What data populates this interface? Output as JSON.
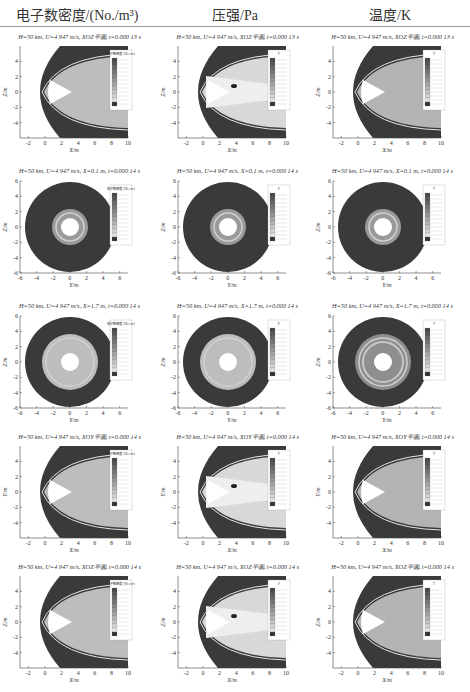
{
  "header": {
    "columns": [
      {
        "label": "电子数密度/(No./m³)",
        "variable": "electron_number_density"
      },
      {
        "label": "压强/Pa",
        "variable": "pressure"
      },
      {
        "label": "温度/K",
        "variable": "temperature"
      }
    ]
  },
  "rows": [
    {
      "caption_0": "H=50 km, U=4 947 m/s, XOZ平面, t=0.000 13 s",
      "caption_1": "H=50 km, U=4 947 m/s, XOZ平面, t=0.000 13 s",
      "caption_2": "H=50 km, U=4 947 m/s, XOZ平面, t=0.000 13 s",
      "kind": "side",
      "xlabel": "X/m",
      "ylabel": "Z/m"
    },
    {
      "caption_0": "H=50 km, U=4 947 m/s, X=0.1 m, t=0.000 14 s",
      "caption_1": "H=50 km, U=4 947 m/s, X=0.1 m, t=0.000 14 s",
      "caption_2": "H=50 km, U=4 947 m/s, X=0.1 m, t=0.000 14 s",
      "kind": "section",
      "xlabel": "Y/m",
      "ylabel": "Z/m"
    },
    {
      "caption_0": "H=50 km, U=4 947 m/s, X=1.7 m, t=0.000 14 s",
      "caption_1": "H=50 km, U=4 947 m/s, X=1.7 m, t=0.000 14 s",
      "caption_2": "H=50 km, U=4 947 m/s, X=1.7 m, t=0.000 14 s",
      "kind": "section",
      "xlabel": "Y/m",
      "ylabel": "Z/m"
    },
    {
      "caption_0": "H=50 km, U=4 947 m/s, XOY平面, t=0.000 14 s",
      "caption_1": "H=50 km, U=4 947 m/s, XOY平面, t=0.000 14 s",
      "caption_2": "H=50 km, U=4 947 m/s, XOY平面, t=0.000 14 s",
      "kind": "side",
      "xlabel": "X/m",
      "ylabel": "Y/m"
    },
    {
      "caption_0": "H=50 km, U=4 947 m/s, XOZ平面, t=0.000 14 s",
      "caption_1": "H=50 km, U=4 947 m/s, XOZ平面, t=0.000 14 s",
      "caption_2": "H=50 km, U=4 947 m/s, XOZ平面, t=0.000 14 s",
      "kind": "side",
      "xlabel": "X/m",
      "ylabel": "Z/m"
    }
  ],
  "legend_titles": {
    "density": "电子数密度 /(No./m³)",
    "pressure": "P",
    "temperature": "T"
  },
  "chart_data": {
    "type": "heatmap",
    "layout": {
      "rows": 5,
      "cols": 3
    },
    "column_titles": [
      "电子数密度/(No./m³)",
      "压强/Pa",
      "温度/K"
    ],
    "side_view_axes": {
      "x_ticks": [
        -2,
        0,
        2,
        4,
        6,
        8,
        10
      ],
      "y_ticks": [
        -4,
        -2,
        0,
        2,
        4
      ],
      "xlim": [
        -3,
        10
      ],
      "ylim": [
        -6,
        6
      ]
    },
    "section_axes": {
      "x_ticks": [
        -6,
        -4,
        -2,
        0,
        2,
        4,
        6
      ],
      "y_ticks": [
        -6,
        -4,
        -2,
        0,
        2,
        4,
        6
      ],
      "xlim": [
        -6,
        7
      ],
      "ylim": [
        -6,
        6
      ]
    },
    "conditions": {
      "altitude_km": 50,
      "velocity_m_s": 4947
    },
    "panels": [
      {
        "row": 1,
        "col": 1,
        "plane": "XOZ",
        "t_s": 0.00013,
        "variable": "electron number density"
      },
      {
        "row": 1,
        "col": 2,
        "plane": "XOZ",
        "t_s": 0.00013,
        "variable": "pressure"
      },
      {
        "row": 1,
        "col": 3,
        "plane": "XOZ",
        "t_s": 0.00013,
        "variable": "temperature"
      },
      {
        "row": 2,
        "col": 1,
        "plane": "X=0.1 m",
        "t_s": 0.00014,
        "variable": "electron number density"
      },
      {
        "row": 2,
        "col": 2,
        "plane": "X=0.1 m",
        "t_s": 0.00014,
        "variable": "pressure"
      },
      {
        "row": 2,
        "col": 3,
        "plane": "X=0.1 m",
        "t_s": 0.00014,
        "variable": "temperature"
      },
      {
        "row": 3,
        "col": 1,
        "plane": "X=1.7 m",
        "t_s": 0.00014,
        "variable": "electron number density"
      },
      {
        "row": 3,
        "col": 2,
        "plane": "X=1.7 m",
        "t_s": 0.00014,
        "variable": "pressure"
      },
      {
        "row": 3,
        "col": 3,
        "plane": "X=1.7 m",
        "t_s": 0.00014,
        "variable": "temperature"
      },
      {
        "row": 4,
        "col": 1,
        "plane": "XOY",
        "t_s": 0.00014,
        "variable": "electron number density"
      },
      {
        "row": 4,
        "col": 2,
        "plane": "XOY",
        "t_s": 0.00014,
        "variable": "pressure"
      },
      {
        "row": 4,
        "col": 3,
        "plane": "XOY",
        "t_s": 0.00014,
        "variable": "temperature"
      },
      {
        "row": 5,
        "col": 1,
        "plane": "XOZ",
        "t_s": 0.00014,
        "variable": "electron number density"
      },
      {
        "row": 5,
        "col": 2,
        "plane": "XOZ",
        "t_s": 0.00014,
        "variable": "pressure"
      },
      {
        "row": 5,
        "col": 3,
        "plane": "XOZ",
        "t_s": 0.00014,
        "variable": "temperature"
      }
    ],
    "legend": {
      "levels": 12,
      "colormap": "grayscale"
    }
  }
}
